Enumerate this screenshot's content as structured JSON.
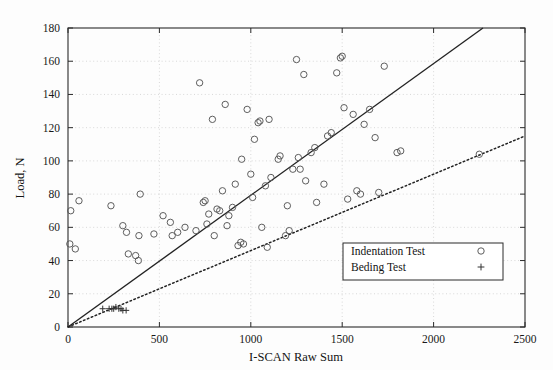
{
  "chart_data": {
    "type": "scatter",
    "title": "",
    "xlabel": "I-SCAN Raw Sum",
    "ylabel": "Load, N",
    "xlim": [
      0,
      2500
    ],
    "ylim": [
      0,
      180
    ],
    "xticks": [
      0,
      500,
      1000,
      1500,
      2000,
      2500
    ],
    "yticks": [
      0,
      20,
      40,
      60,
      80,
      100,
      120,
      140,
      160,
      180
    ],
    "grid": true,
    "grid_style": "dotted",
    "legend_position": "lower right",
    "series": [
      {
        "name": "Indentation Test",
        "marker": "circle",
        "marker_color": "#555555",
        "points": [
          [
            10,
            50
          ],
          [
            15,
            70
          ],
          [
            40,
            47
          ],
          [
            60,
            76
          ],
          [
            235,
            73
          ],
          [
            300,
            61
          ],
          [
            320,
            57
          ],
          [
            330,
            44
          ],
          [
            370,
            43
          ],
          [
            385,
            40
          ],
          [
            388,
            55
          ],
          [
            395,
            80
          ],
          [
            470,
            56
          ],
          [
            520,
            67
          ],
          [
            560,
            63
          ],
          [
            570,
            55
          ],
          [
            600,
            57
          ],
          [
            640,
            60
          ],
          [
            700,
            58
          ],
          [
            720,
            147
          ],
          [
            740,
            75
          ],
          [
            750,
            76
          ],
          [
            760,
            62
          ],
          [
            770,
            68
          ],
          [
            790,
            125
          ],
          [
            800,
            55
          ],
          [
            815,
            71
          ],
          [
            830,
            70
          ],
          [
            845,
            82
          ],
          [
            860,
            134
          ],
          [
            870,
            61
          ],
          [
            880,
            67
          ],
          [
            900,
            72
          ],
          [
            915,
            86
          ],
          [
            930,
            49
          ],
          [
            945,
            51
          ],
          [
            950,
            101
          ],
          [
            960,
            50
          ],
          [
            980,
            131
          ],
          [
            1000,
            92
          ],
          [
            1010,
            78
          ],
          [
            1020,
            113
          ],
          [
            1040,
            123
          ],
          [
            1050,
            124
          ],
          [
            1060,
            60
          ],
          [
            1080,
            85
          ],
          [
            1090,
            48
          ],
          [
            1100,
            125
          ],
          [
            1110,
            90
          ],
          [
            1150,
            101
          ],
          [
            1160,
            103
          ],
          [
            1190,
            55
          ],
          [
            1200,
            73
          ],
          [
            1210,
            58
          ],
          [
            1230,
            95
          ],
          [
            1250,
            161
          ],
          [
            1260,
            102
          ],
          [
            1270,
            95
          ],
          [
            1290,
            152
          ],
          [
            1300,
            88
          ],
          [
            1330,
            105
          ],
          [
            1350,
            108
          ],
          [
            1360,
            75
          ],
          [
            1400,
            86
          ],
          [
            1420,
            115
          ],
          [
            1440,
            117
          ],
          [
            1470,
            153
          ],
          [
            1490,
            162
          ],
          [
            1500,
            163
          ],
          [
            1510,
            132
          ],
          [
            1530,
            77
          ],
          [
            1560,
            128
          ],
          [
            1580,
            82
          ],
          [
            1600,
            80
          ],
          [
            1620,
            122
          ],
          [
            1650,
            131
          ],
          [
            1680,
            114
          ],
          [
            1700,
            81
          ],
          [
            1730,
            157
          ],
          [
            1800,
            105
          ],
          [
            1820,
            106
          ],
          [
            2250,
            104
          ]
        ]
      },
      {
        "name": "Beding Test",
        "marker": "plus",
        "marker_color": "#333333",
        "points": [
          [
            190,
            11
          ],
          [
            225,
            11
          ],
          [
            240,
            11
          ],
          [
            250,
            11
          ],
          [
            262,
            12
          ],
          [
            278,
            11
          ],
          [
            290,
            11
          ],
          [
            300,
            10
          ],
          [
            318,
            10
          ]
        ]
      }
    ],
    "fit_lines": [
      {
        "name": "indentation-fit",
        "style": "solid",
        "color": "#222222",
        "from": [
          0,
          0
        ],
        "to": [
          2270,
          180
        ]
      },
      {
        "name": "bending-fit",
        "style": "dotted",
        "color": "#222222",
        "from": [
          0,
          0
        ],
        "to": [
          2500,
          115
        ]
      }
    ]
  },
  "legend": {
    "entries": [
      {
        "label": "Indentation Test",
        "marker": "circle"
      },
      {
        "label": "Beding Test",
        "marker": "plus"
      }
    ]
  }
}
